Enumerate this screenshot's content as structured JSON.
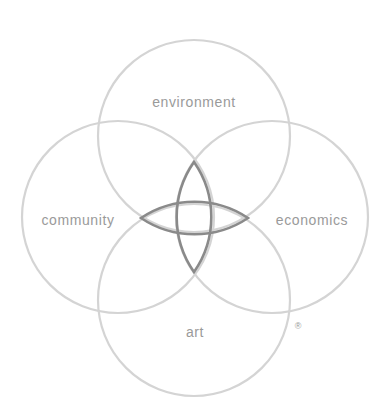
{
  "diagram": {
    "type": "four-circle venn",
    "colors": {
      "circle_stroke": "#d4d4d4",
      "core_stroke": "#8a8a8a",
      "label_text": "#9a9a9a",
      "background": "#ffffff"
    },
    "circles": [
      {
        "id": "environment",
        "label": "environment",
        "position": "top"
      },
      {
        "id": "community",
        "label": "community",
        "position": "left"
      },
      {
        "id": "economics",
        "label": "economics",
        "position": "right"
      },
      {
        "id": "art",
        "label": "art",
        "position": "bottom"
      }
    ],
    "trademark": "®"
  }
}
